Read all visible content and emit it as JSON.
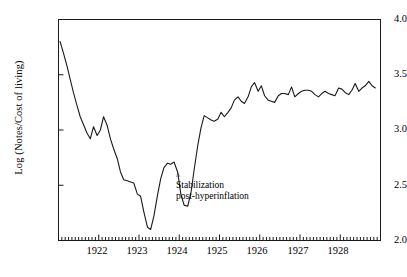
{
  "chart_data": {
    "type": "line",
    "title": "",
    "subtitle": "",
    "xlabel": "",
    "ylabel": "Log (Notes/Cost of living)",
    "xlim": [
      1921.0,
      1929.0
    ],
    "ylim": [
      2.0,
      4.0
    ],
    "grid": false,
    "legend": null,
    "y_ticks": [
      "4.0",
      "3.5",
      "3.0",
      "2.5",
      "2.0"
    ],
    "y_tick_values": [
      4.0,
      3.5,
      3.0,
      2.5,
      2.0
    ],
    "x_ticks": [
      "1922",
      "1923",
      "1924",
      "1925",
      "1926",
      "1927",
      "1928"
    ],
    "x_tick_values": [
      1922,
      1923,
      1924,
      1925,
      1926,
      1927,
      1928
    ],
    "x_minor_tick_interval_months": 1,
    "line_color": "#1a1a1a",
    "annotations": [
      {
        "marker": "^",
        "text_line1": "Stabilization",
        "text_line2": "post-hyperinflation",
        "x": 1923.95,
        "y": 2.66
      }
    ],
    "series": [
      {
        "name": "Log (Notes/Cost of living)",
        "x": [
          1921.04,
          1921.12,
          1921.21,
          1921.29,
          1921.37,
          1921.46,
          1921.54,
          1921.62,
          1921.71,
          1921.79,
          1921.87,
          1921.96,
          1922.04,
          1922.12,
          1922.21,
          1922.29,
          1922.37,
          1922.46,
          1922.54,
          1922.62,
          1922.71,
          1922.79,
          1922.87,
          1922.96,
          1923.04,
          1923.12,
          1923.21,
          1923.29,
          1923.37,
          1923.46,
          1923.54,
          1923.62,
          1923.71,
          1923.79,
          1923.87,
          1923.96,
          1924.04,
          1924.12,
          1924.21,
          1924.29,
          1924.37,
          1924.46,
          1924.54,
          1924.62,
          1924.71,
          1924.79,
          1924.87,
          1924.96,
          1925.04,
          1925.12,
          1925.21,
          1925.29,
          1925.37,
          1925.46,
          1925.54,
          1925.62,
          1925.71,
          1925.79,
          1925.87,
          1925.96,
          1926.04,
          1926.12,
          1926.21,
          1926.29,
          1926.37,
          1926.46,
          1926.54,
          1926.62,
          1926.71,
          1926.79,
          1926.87,
          1926.96,
          1927.04,
          1927.12,
          1927.21,
          1927.29,
          1927.37,
          1927.46,
          1927.54,
          1927.62,
          1927.71,
          1927.79,
          1927.87,
          1927.96,
          1928.04,
          1928.12,
          1928.21,
          1928.29,
          1928.37,
          1928.46,
          1928.54,
          1928.62,
          1928.71,
          1928.79,
          1928.87
        ],
        "y": [
          3.8,
          3.7,
          3.58,
          3.46,
          3.34,
          3.22,
          3.12,
          3.05,
          2.97,
          2.92,
          3.03,
          2.95,
          3.0,
          3.12,
          3.04,
          2.92,
          2.83,
          2.74,
          2.62,
          2.55,
          2.54,
          2.53,
          2.52,
          2.42,
          2.4,
          2.26,
          2.12,
          2.1,
          2.22,
          2.41,
          2.56,
          2.66,
          2.7,
          2.69,
          2.71,
          2.62,
          2.42,
          2.32,
          2.31,
          2.43,
          2.64,
          2.86,
          3.02,
          3.13,
          3.11,
          3.09,
          3.08,
          3.1,
          3.16,
          3.12,
          3.16,
          3.2,
          3.27,
          3.3,
          3.26,
          3.24,
          3.3,
          3.39,
          3.43,
          3.35,
          3.4,
          3.31,
          3.27,
          3.26,
          3.25,
          3.31,
          3.33,
          3.33,
          3.32,
          3.39,
          3.3,
          3.33,
          3.35,
          3.36,
          3.36,
          3.35,
          3.32,
          3.3,
          3.33,
          3.35,
          3.33,
          3.32,
          3.31,
          3.38,
          3.37,
          3.34,
          3.32,
          3.36,
          3.42,
          3.35,
          3.38,
          3.4,
          3.44,
          3.4,
          3.38
        ]
      }
    ]
  }
}
